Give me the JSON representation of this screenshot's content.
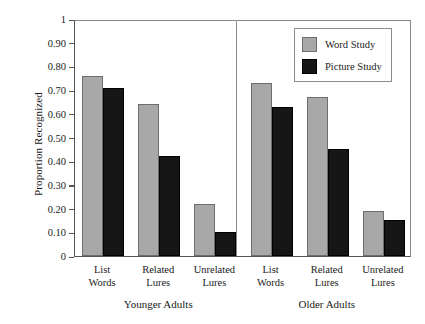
{
  "chart_data": {
    "type": "bar",
    "title": "",
    "xlabel": "",
    "ylabel": "Proportion Recognized",
    "ylim": [
      0,
      1
    ],
    "ytick_labels": [
      "1",
      "0.90",
      "0.80",
      "0.70",
      "0.60",
      "0.50",
      "0.40",
      "0.30",
      "0.20",
      "0.10",
      "0"
    ],
    "ytick_values": [
      1,
      0.9,
      0.8,
      0.7,
      0.6,
      0.5,
      0.4,
      0.3,
      0.2,
      0.1,
      0
    ],
    "grid": false,
    "legend_position": "top-right",
    "legend": [
      "Word Study",
      "Picture Study"
    ],
    "categories": [
      "List Words",
      "Related Lures",
      "Unrelated Lures"
    ],
    "panels": [
      {
        "name": "Younger Adults",
        "categories": [
          "List Words",
          "Related Lures",
          "Unrelated Lures"
        ],
        "series": [
          {
            "name": "Word Study",
            "color": "#a8a8a8",
            "values": [
              0.76,
              0.64,
              0.22
            ]
          },
          {
            "name": "Picture Study",
            "color": "#161616",
            "values": [
              0.71,
              0.42,
              0.1
            ]
          }
        ]
      },
      {
        "name": "Older Adults",
        "categories": [
          "List Words",
          "Related Lures",
          "Unrelated Lures"
        ],
        "series": [
          {
            "name": "Word Study",
            "color": "#a8a8a8",
            "values": [
              0.73,
              0.67,
              0.19
            ]
          },
          {
            "name": "Picture Study",
            "color": "#161616",
            "values": [
              0.63,
              0.45,
              0.15
            ]
          }
        ]
      }
    ],
    "colors": {
      "word_study": "#a8a8a8",
      "picture_study": "#161616",
      "axis": "#555555",
      "divider": "#8a8a8a",
      "background": "#ffffff"
    }
  }
}
